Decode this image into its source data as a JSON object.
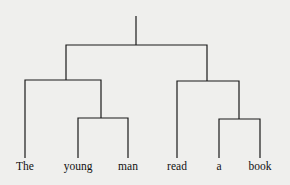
{
  "diagram": {
    "type": "constituency-tree",
    "leaves": [
      {
        "id": "w1",
        "label": "The",
        "x": 25
      },
      {
        "id": "w2",
        "label": "young",
        "x": 78
      },
      {
        "id": "w3",
        "label": "man",
        "x": 128
      },
      {
        "id": "w4",
        "label": "read",
        "x": 177
      },
      {
        "id": "w5",
        "label": "a",
        "x": 219
      },
      {
        "id": "w6",
        "label": "book",
        "x": 260
      }
    ],
    "structure": "[[The [young man]] [read [a book]]]",
    "colors": {
      "line": "#1a1a1a",
      "text": "#111111",
      "background": "#efefed"
    }
  }
}
